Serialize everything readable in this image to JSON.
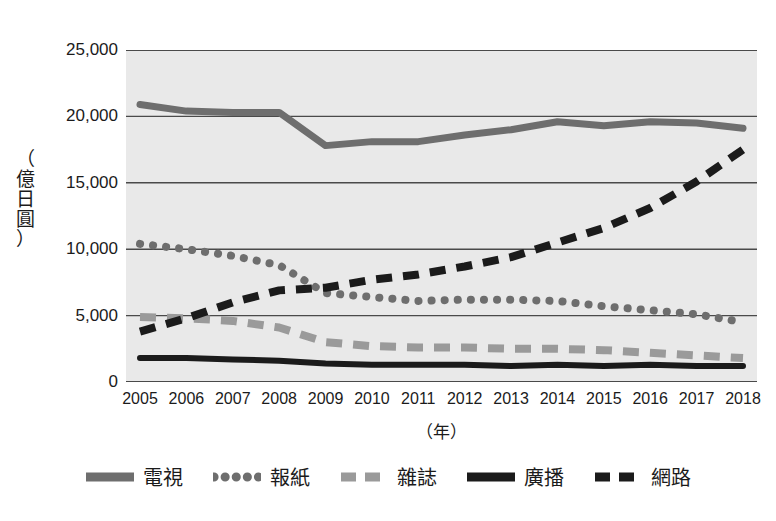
{
  "chart_data": {
    "type": "line",
    "title": "",
    "xlabel": "（年）",
    "ylabel": "（億日圓）",
    "ylabel_chars": "（\n億\n日\n圓\n）",
    "xlim": [
      2005,
      2018
    ],
    "ylim": [
      0,
      25000
    ],
    "yticks": [
      0,
      5000,
      10000,
      15000,
      20000,
      25000
    ],
    "ytick_labels": [
      "0",
      "5,000",
      "10,000",
      "15,000",
      "20,000",
      "25,000"
    ],
    "categories": [
      2005,
      2006,
      2007,
      2008,
      2009,
      2010,
      2011,
      2012,
      2013,
      2014,
      2015,
      2016,
      2017,
      2018
    ],
    "xtick_labels": [
      "2005",
      "2006",
      "2007",
      "2008",
      "2009",
      "2010",
      "2011",
      "2012",
      "2013",
      "2014",
      "2015",
      "2016",
      "2017",
      "2018"
    ],
    "grid": true,
    "legend_position": "bottom",
    "plot_background": "#e9e9e9",
    "series": [
      {
        "name": "電視",
        "style": "solid",
        "color": "#6e6e6e",
        "width": 7,
        "values": [
          20900,
          20400,
          20300,
          20300,
          17800,
          18100,
          18100,
          18600,
          19000,
          19600,
          19300,
          19600,
          19500,
          19100
        ]
      },
      {
        "name": "報紙",
        "style": "dotted",
        "color": "#6e6e6e",
        "width": 8,
        "values": [
          10400,
          10000,
          9500,
          8800,
          6700,
          6400,
          6100,
          6200,
          6200,
          6100,
          5700,
          5400,
          5100,
          4500
        ]
      },
      {
        "name": "雜誌",
        "style": "dashed",
        "color": "#9a9a9a",
        "width": 8,
        "values": [
          4900,
          4800,
          4600,
          4100,
          3000,
          2700,
          2600,
          2600,
          2500,
          2500,
          2400,
          2200,
          2000,
          1800
        ]
      },
      {
        "name": "廣播",
        "style": "solid",
        "color": "#1b1b1b",
        "width": 6,
        "values": [
          1800,
          1800,
          1700,
          1600,
          1400,
          1300,
          1300,
          1300,
          1200,
          1300,
          1200,
          1300,
          1200,
          1200
        ]
      },
      {
        "name": "網路",
        "style": "dashed",
        "color": "#1b1b1b",
        "width": 8,
        "values": [
          3800,
          4800,
          6000,
          6900,
          7100,
          7700,
          8100,
          8700,
          9400,
          10500,
          11600,
          13100,
          15100,
          17500
        ]
      }
    ]
  },
  "legend": {
    "items": [
      {
        "label": "電視",
        "color": "#6e6e6e",
        "style": "solid"
      },
      {
        "label": "報紙",
        "color": "#6e6e6e",
        "style": "dotted"
      },
      {
        "label": "雜誌",
        "color": "#9a9a9a",
        "style": "dashed"
      },
      {
        "label": "廣播",
        "color": "#1b1b1b",
        "style": "solid"
      },
      {
        "label": "網路",
        "color": "#1b1b1b",
        "style": "dashed"
      }
    ]
  }
}
